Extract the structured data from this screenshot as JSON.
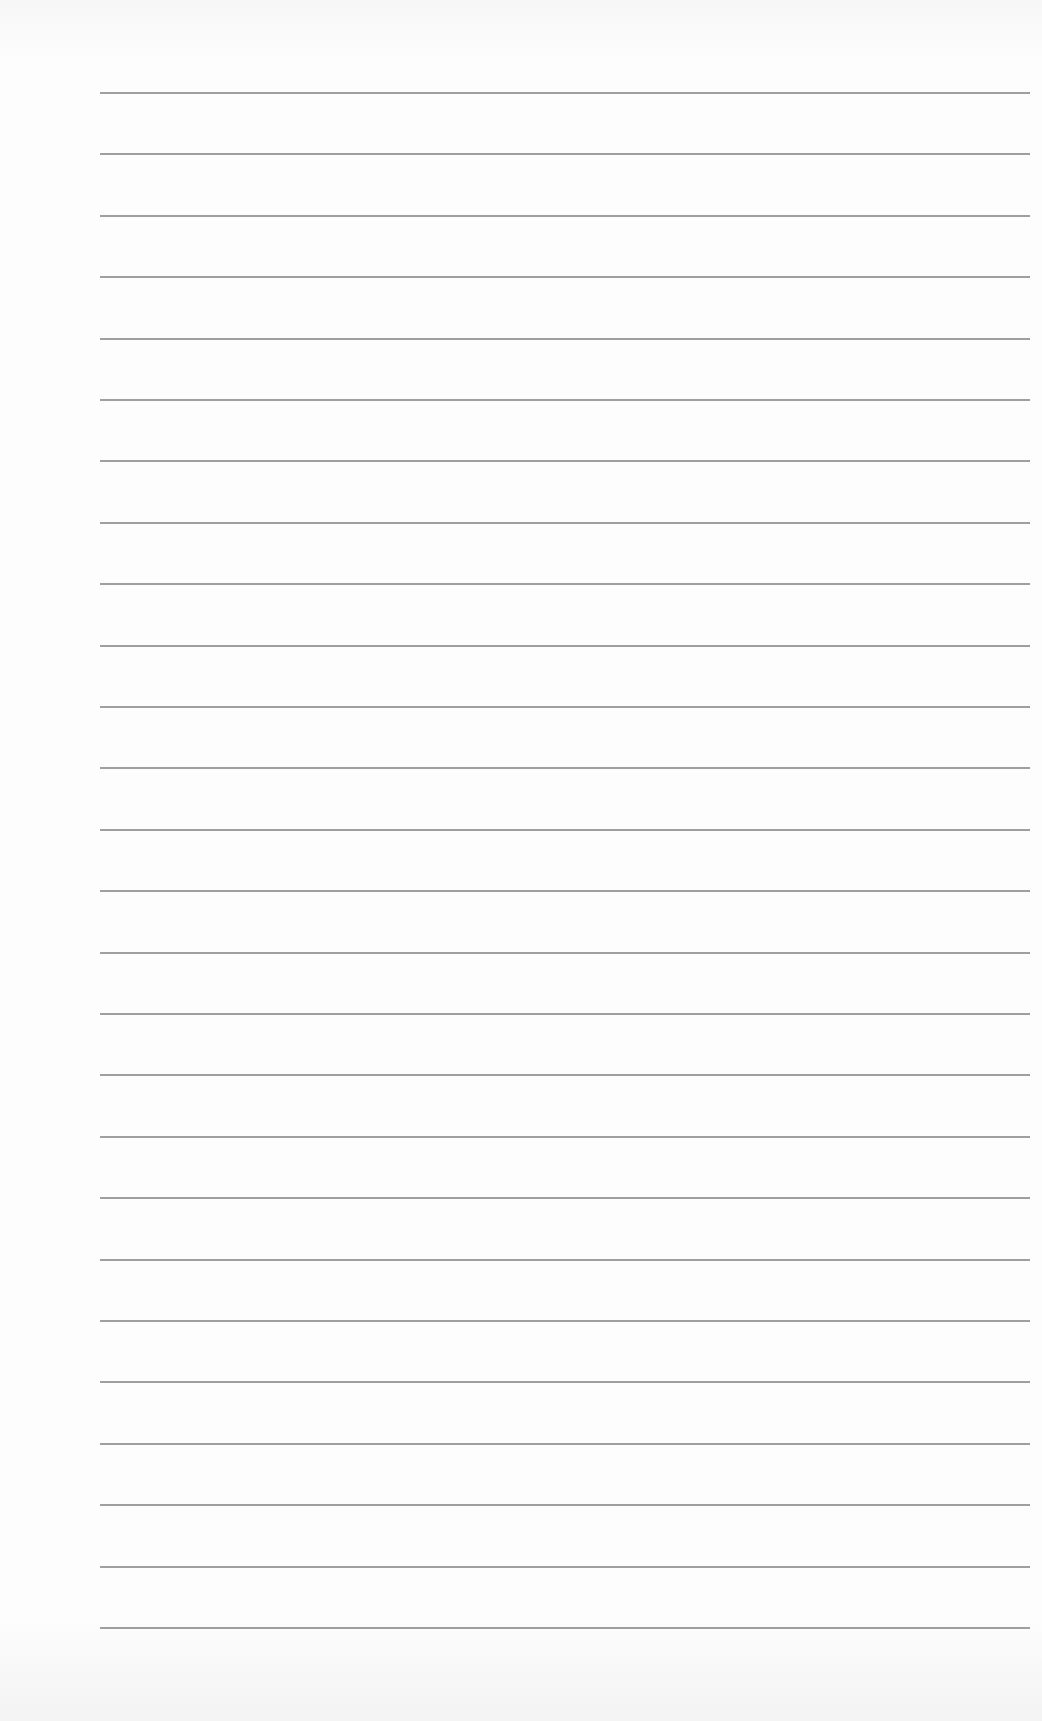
{
  "page": {
    "type": "lined-paper",
    "background_color": "#fbfbfb",
    "line_color": "#8e8e8e",
    "line_count": 26,
    "first_line_y": 92,
    "line_spacing": 61.4,
    "line_left_x": 100,
    "line_right_x": 1030
  }
}
